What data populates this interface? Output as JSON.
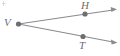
{
  "figure": {
    "kind": "angle-diagram",
    "width": 120,
    "height": 56,
    "background_color": "#ffffff",
    "stroke_color": "#8a8a8f",
    "point_color": "#6e6e72",
    "label_color": "#6e6e72",
    "vertex_name": "V",
    "ray_count": 2,
    "angle_name": "HVT"
  },
  "points": [
    {
      "id": "V",
      "label": "V",
      "role": "vertex",
      "x": 18.5,
      "y": 24.0,
      "radius": 2.6,
      "label_x": 4,
      "label_y": 17
    },
    {
      "id": "H",
      "label": "H",
      "role": "ray-point",
      "x": 85.0,
      "y": 14.0,
      "radius": 2.6,
      "label_x": 81,
      "label_y": 0
    },
    {
      "id": "T",
      "label": "T",
      "role": "ray-point",
      "x": 83.0,
      "y": 36.5,
      "radius": 2.6,
      "label_x": 79,
      "label_y": 40
    }
  ],
  "rays": [
    {
      "id": "ray-VH",
      "name": "ray-v-through-h",
      "from": "V",
      "through": "H",
      "start": {
        "x": 18.5,
        "y": 24.0
      },
      "end": {
        "x": 115.0,
        "y": 9.5
      },
      "arrowhead": "end",
      "arrow_tip": {
        "x": 115.0,
        "y": 9.5
      }
    },
    {
      "id": "ray-VT",
      "name": "ray-v-through-t",
      "from": "V",
      "through": "T",
      "start": {
        "x": 18.5,
        "y": 24.0
      },
      "end": {
        "x": 115.5,
        "y": 42.5
      },
      "arrowhead": "end",
      "arrow_tip": {
        "x": 115.5,
        "y": 42.5
      }
    }
  ],
  "artifacts": [
    {
      "id": "corner-speck",
      "name": "scan-speck",
      "x": 2,
      "y": 1
    }
  ]
}
